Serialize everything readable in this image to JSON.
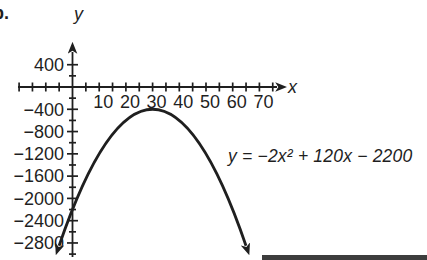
{
  "item_label": "b.",
  "colors": {
    "ink": "#1f1f1f",
    "background": "#ffffff",
    "scan_band": "#3d3d3d"
  },
  "chart_data": {
    "type": "line",
    "title": "",
    "xlabel": "x",
    "ylabel": "y",
    "equation_label": "y = −2x² + 120x − 2200",
    "function_coefficients": {
      "a": -2,
      "b": 120,
      "c": -2200
    },
    "domain_drawn": [
      -5,
      65
    ],
    "x_ticks": {
      "labeled_values": [
        10,
        20,
        30,
        40,
        50,
        60,
        70
      ],
      "labels": [
        "10",
        "20",
        "30",
        "40",
        "50",
        "60",
        "70"
      ],
      "minor_step": 5,
      "drawn_range": [
        -20,
        75
      ]
    },
    "y_ticks": {
      "labeled_values": [
        400,
        -400,
        -800,
        -1200,
        -1600,
        -2000,
        -2400,
        -2800
      ],
      "labels": [
        "400",
        "−400",
        "−800",
        "−1200",
        "−1600",
        "−2000",
        "−2400",
        "−2800"
      ],
      "minor_step": 200,
      "drawn_range": [
        -3000,
        400
      ]
    },
    "vertex": [
      30,
      -400
    ],
    "y_intercept": [
      0,
      -2200
    ],
    "points": [
      [
        0,
        -2200
      ],
      [
        10,
        -1200
      ],
      [
        20,
        -600
      ],
      [
        30,
        -400
      ],
      [
        40,
        -600
      ],
      [
        50,
        -1200
      ],
      [
        60,
        -2200
      ]
    ],
    "grid": false,
    "legend": null
  }
}
